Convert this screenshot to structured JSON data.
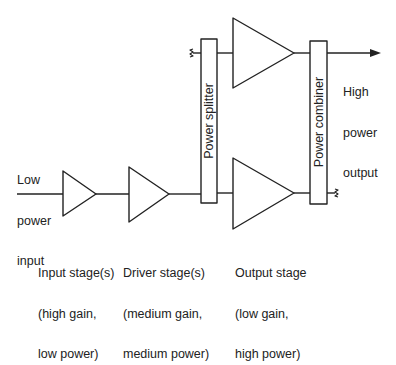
{
  "diagram": {
    "title": "",
    "input": {
      "lines": [
        "Low",
        "power",
        "input"
      ]
    },
    "output": {
      "lines": [
        "High",
        "power",
        "output"
      ]
    },
    "splitter": {
      "label": "Power splitter"
    },
    "combiner": {
      "label": "Power combiner"
    },
    "stages": [
      {
        "id": "input-stage",
        "lines": [
          "Input stage(s)",
          "(high gain,",
          "low power)"
        ]
      },
      {
        "id": "driver-stage",
        "lines": [
          "Driver stage(s)",
          "(medium gain,",
          "medium power)"
        ]
      },
      {
        "id": "output-stage",
        "lines": [
          "Output stage",
          "(low gain,",
          "high power)"
        ]
      }
    ],
    "colors": {
      "stroke": "#222222",
      "background": "#ffffff"
    }
  }
}
